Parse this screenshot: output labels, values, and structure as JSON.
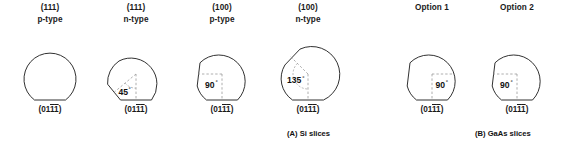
{
  "figure": {
    "groups": [
      {
        "id": "si",
        "caption": "(A) Si slices",
        "wafers": [
          {
            "id": "si-111-p",
            "plane": "(111)",
            "doping": "p-type",
            "index_prefix": "(01",
            "index_bar1": "1",
            "index_bar2": "1",
            "index_suffix": ")",
            "angle": "",
            "degree_symbol": "",
            "has_secondary_flat": false,
            "secondary_flat_position": "none"
          },
          {
            "id": "si-111-n",
            "plane": "(111)",
            "doping": "n-type",
            "index_prefix": "(01",
            "index_bar1": "1",
            "index_bar2": "1",
            "index_suffix": ")",
            "angle": "45",
            "degree_symbol": "°",
            "has_secondary_flat": true,
            "secondary_flat_position": "lower-left"
          },
          {
            "id": "si-100-p",
            "plane": "(100)",
            "doping": "p-type",
            "index_prefix": "(01",
            "index_bar1": "1",
            "index_bar2": "1",
            "index_suffix": ")",
            "angle": "90",
            "degree_symbol": "°",
            "has_secondary_flat": true,
            "secondary_flat_position": "left"
          },
          {
            "id": "si-100-n",
            "plane": "(100)",
            "doping": "n-type",
            "index_prefix": "(01",
            "index_bar1": "1",
            "index_bar2": "1",
            "index_suffix": ")",
            "angle": "135",
            "degree_symbol": "°",
            "has_secondary_flat": true,
            "secondary_flat_position": "upper-left"
          }
        ]
      },
      {
        "id": "gaas",
        "caption": "(B) GaAs slices",
        "wafers": [
          {
            "id": "gaas-option-1",
            "plane": "Option 1",
            "doping": "",
            "index_prefix": "(01",
            "index_bar1": "1",
            "index_bar2": "1",
            "index_suffix": ")",
            "angle": "90",
            "degree_symbol": "°",
            "has_secondary_flat": true,
            "secondary_flat_position": "left"
          },
          {
            "id": "gaas-option-2",
            "plane": "Option 2",
            "doping": "",
            "index_prefix": "(01",
            "index_bar1": "1",
            "index_bar2": "1",
            "index_suffix": ")",
            "angle": "90",
            "degree_symbol": "°",
            "has_secondary_flat": true,
            "secondary_flat_position": "left"
          }
        ]
      }
    ],
    "colors": {
      "outline": "#1a1a1a",
      "dashed": "#9a9a9a",
      "text": "#111111",
      "background": "#ffffff"
    }
  }
}
